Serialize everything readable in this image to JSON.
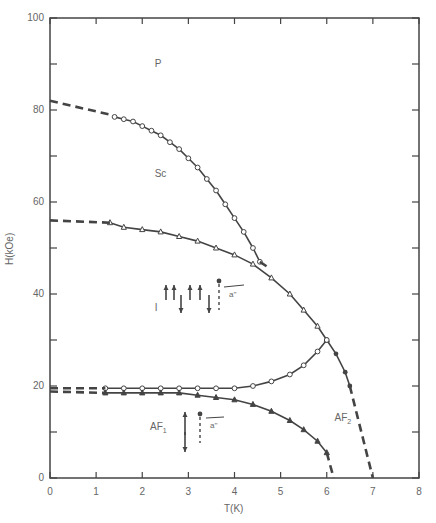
{
  "chart_data": {
    "type": "scatter",
    "title": "",
    "xlabel": "T(K)",
    "ylabel": "H(kOe)",
    "xlim": [
      0,
      8
    ],
    "ylim": [
      0,
      100
    ],
    "x_ticks": [
      "0",
      "1",
      "2",
      "3",
      "4",
      "5",
      "6",
      "7",
      "8"
    ],
    "y_ticks": [
      "0",
      "20",
      "40",
      "60",
      "80",
      "100"
    ],
    "grid": false,
    "legend": null,
    "regions": [
      {
        "label": "P",
        "T": 2.4,
        "H": 90
      },
      {
        "label": "Sc",
        "T": 2.4,
        "H": 66
      },
      {
        "label": "I",
        "T": 2.4,
        "H": 37
      },
      {
        "label": "AF1",
        "T": 2.3,
        "H": 11
      },
      {
        "label": "AF2",
        "T": 6.3,
        "H": 13
      }
    ],
    "annotations": [
      "a''",
      "a''"
    ],
    "series": [
      {
        "name": "P-Sc boundary (open circles)",
        "marker": "o",
        "T": [
          1.4,
          1.6,
          1.8,
          2.0,
          2.2,
          2.4,
          2.6,
          2.8,
          3.0,
          3.2,
          3.4,
          3.6,
          3.8,
          4.0,
          4.2,
          4.4,
          4.55
        ],
        "H": [
          78.5,
          78,
          77.5,
          76.5,
          75.5,
          74.5,
          73,
          71.5,
          69.5,
          67.5,
          65,
          62.5,
          59.5,
          56.5,
          53.5,
          50,
          47
        ]
      },
      {
        "name": "Sc-I boundary (triangles)",
        "marker": "^",
        "T": [
          1.3,
          1.6,
          2.0,
          2.4,
          2.8,
          3.2,
          3.6,
          4.0,
          4.4,
          4.8,
          5.2,
          5.5,
          5.8,
          6.0
        ],
        "H": [
          55.5,
          54.5,
          54,
          53.5,
          52.5,
          51.5,
          50,
          48.5,
          46.5,
          43.5,
          40,
          36.5,
          33,
          30
        ]
      },
      {
        "name": "I-AF2 / P-AF2 boundary (filled)",
        "marker": "s",
        "T": [
          6.0,
          6.2,
          6.4,
          6.5
        ],
        "H": [
          30,
          27,
          23,
          20
        ]
      },
      {
        "name": "I-AF1 boundary upper (open circles)",
        "marker": "o",
        "T": [
          1.2,
          1.6,
          2.0,
          2.4,
          2.8,
          3.2,
          3.6,
          4.0,
          4.4,
          4.8,
          5.2,
          5.5,
          5.8,
          6.0
        ],
        "H": [
          19.5,
          19.5,
          19.5,
          19.5,
          19.5,
          19.5,
          19.5,
          19.5,
          20,
          21,
          22.5,
          24.5,
          27.5,
          30
        ]
      },
      {
        "name": "AF1-AF2 boundary (filled triangles)",
        "marker": "^",
        "T": [
          1.2,
          1.6,
          2.0,
          2.4,
          2.8,
          3.2,
          3.6,
          4.0,
          4.4,
          4.8,
          5.2,
          5.5,
          5.8,
          6.0
        ],
        "H": [
          18.5,
          18.5,
          18.5,
          18.5,
          18.5,
          18,
          17.5,
          17,
          16,
          14.5,
          12.5,
          10.5,
          8,
          5.5
        ]
      }
    ],
    "dashed_extrapolations": [
      {
        "from": [
          0,
          82
        ],
        "to": [
          1.3,
          79
        ]
      },
      {
        "from": [
          0,
          56
        ],
        "to": [
          1.3,
          55.5
        ]
      },
      {
        "from": [
          0,
          19.5
        ],
        "to": [
          1.2,
          19.5
        ]
      },
      {
        "from": [
          0,
          18.8
        ],
        "to": [
          1.2,
          18.5
        ]
      },
      {
        "from": [
          4.55,
          47
        ],
        "to": [
          4.7,
          46
        ]
      },
      {
        "from": [
          6.0,
          5.5
        ],
        "to": [
          6.15,
          0
        ]
      },
      {
        "from": [
          6.5,
          20
        ],
        "to": [
          7.0,
          0
        ]
      }
    ]
  }
}
